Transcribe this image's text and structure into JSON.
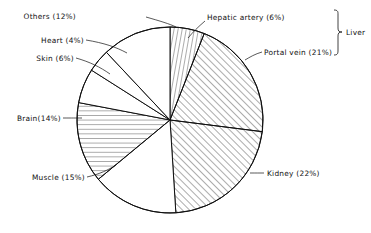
{
  "figure": {
    "background_color": "#ffffff",
    "line_color": "#111111"
  },
  "bracket": {
    "label": "Liver",
    "groups_slices": [
      "Hepatic artery (6%)",
      "Portal vein (21%)"
    ]
  },
  "labels": {
    "others": "Others (12%)",
    "heart": "Heart (4%)",
    "skin": "Skin (6%)",
    "brain": "Brain(14%)",
    "muscle": "Muscle (15%)",
    "kidney": "Kidney (22%)",
    "hepatic_artery": "Hepatic artery (6%)",
    "portal_vein": "Portal vein (21%)"
  },
  "chart_data": {
    "type": "pie",
    "title": "",
    "xlabel": "",
    "ylabel": "",
    "legend_position": "callout-labels",
    "grid": false,
    "start_angle_deg": 0,
    "direction": "clockwise",
    "center": [
      170,
      120
    ],
    "radius": 93,
    "units": "percent",
    "total": 100,
    "categories": [
      "Hepatic artery",
      "Portal vein",
      "Kidney",
      "Muscle",
      "Brain",
      "Skin",
      "Heart",
      "Others"
    ],
    "values": [
      6,
      21,
      22,
      15,
      14,
      6,
      4,
      12
    ],
    "slices": [
      {
        "name": "Hepatic artery",
        "label": "Hepatic artery (6%)",
        "value": 6,
        "fill_pattern": "vertical-hatch",
        "start_deg": 0,
        "end_deg": 21.6
      },
      {
        "name": "Portal vein",
        "label": "Portal vein (21%)",
        "value": 21,
        "fill_pattern": "diagonal-hatch",
        "start_deg": 21.6,
        "end_deg": 97.2
      },
      {
        "name": "Kidney",
        "label": "Kidney (22%)",
        "value": 22,
        "fill_pattern": "diagonal-hatch",
        "start_deg": 97.2,
        "end_deg": 176.4
      },
      {
        "name": "Muscle",
        "label": "Muscle (15%)",
        "value": 15,
        "fill_pattern": "none",
        "start_deg": 176.4,
        "end_deg": 230.4
      },
      {
        "name": "Brain",
        "label": "Brain(14%)",
        "value": 14,
        "fill_pattern": "horizontal-hatch",
        "start_deg": 230.4,
        "end_deg": 280.8
      },
      {
        "name": "Skin",
        "label": "Skin (6%)",
        "value": 6,
        "fill_pattern": "none",
        "start_deg": 280.8,
        "end_deg": 302.4
      },
      {
        "name": "Heart",
        "label": "Heart (4%)",
        "value": 4,
        "fill_pattern": "none",
        "start_deg": 302.4,
        "end_deg": 316.8
      },
      {
        "name": "Others",
        "label": "Others (12%)",
        "value": 12,
        "fill_pattern": "none",
        "start_deg": 316.8,
        "end_deg": 360
      }
    ]
  }
}
